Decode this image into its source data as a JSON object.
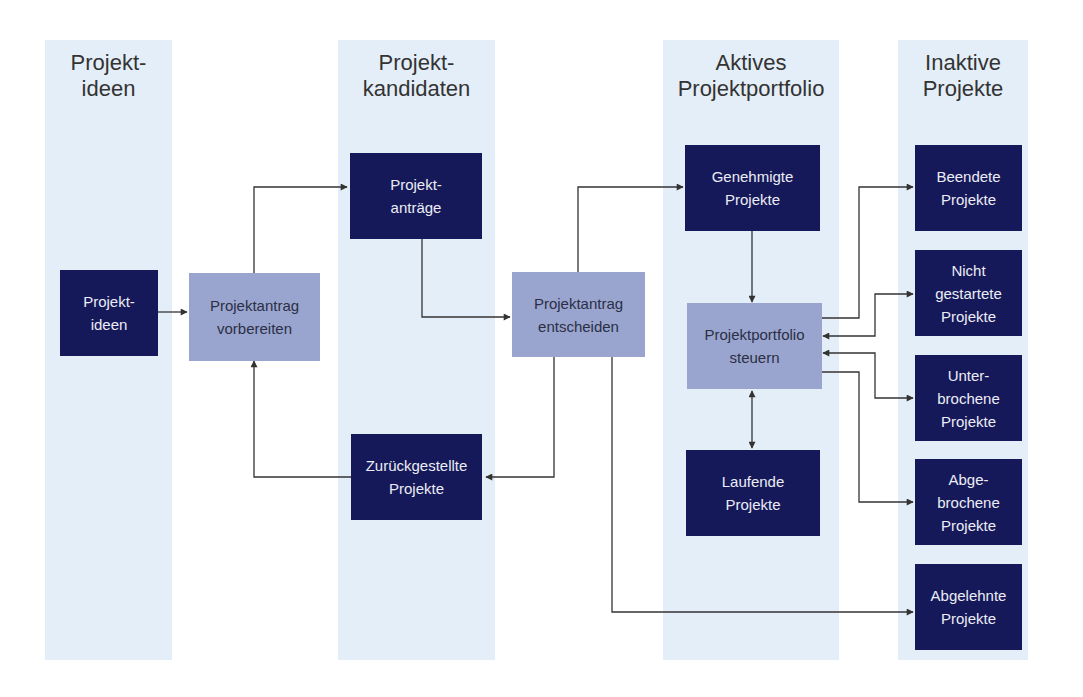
{
  "lanes": [
    {
      "title": "Projekt-\nideen"
    },
    {
      "title": "Projekt-\nkandidaten"
    },
    {
      "title": "Aktives\nProjektportfolio"
    },
    {
      "title": "Inaktive\nProjekte"
    }
  ],
  "nodes": {
    "projektideen": "Projekt-\nideen",
    "antrag_vorbereiten": "Projektantrag\nvorbereiten",
    "projektantraege": "Projekt-\nanträge",
    "zurueckgestellte": "Zurückgestellte\nProjekte",
    "antrag_entscheiden": "Projektantrag\nentscheiden",
    "genehmigte": "Genehmigte\nProjekte",
    "portfolio_steuern": "Projektportfolio\nsteuern",
    "laufende": "Laufende\nProjekte",
    "beendete": "Beendete\nProjekte",
    "nicht_gestartete": "Nicht\ngestartete\nProjekte",
    "unterbrochene": "Unter-\nbrochene\nProjekte",
    "abgebrochene": "Abge-\nbrochene\nProjekte",
    "abgelehnte": "Abgelehnte\nProjekte"
  },
  "colors": {
    "lane_bg": "#e4eef8",
    "state_box": "#15195a",
    "process_box": "#9aa5cf",
    "connector": "#333333"
  }
}
